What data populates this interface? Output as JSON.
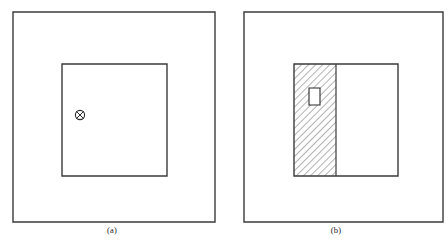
{
  "figure": {
    "background_color": "#ffffff",
    "line_color": "#3b3b3b",
    "panel_count": 2
  },
  "panels": [
    {
      "id": "a",
      "caption": "(a)",
      "outer_square": {
        "x": 13,
        "y": 12,
        "width": 202,
        "height": 210
      },
      "inner_square": {
        "x": 62,
        "y": 64,
        "width": 105,
        "height": 112
      },
      "symbols": [
        {
          "name": "vector-into-page",
          "glyph": "circled-x",
          "cx": 80,
          "cy": 115,
          "r": 5
        }
      ]
    },
    {
      "id": "b",
      "caption": "(b)",
      "outer_square": {
        "x": 20,
        "y": 12,
        "width": 199,
        "height": 210
      },
      "inner_square": {
        "x": 70,
        "y": 64,
        "width": 104,
        "height": 112
      },
      "hatched_region": {
        "x": 70,
        "y": 64,
        "width": 42,
        "height": 112,
        "hatch_angle_deg": 45,
        "hatch_direction": "lower-left-to-upper-right",
        "hatch_spacing_px": 5,
        "hatch_color": "#555555"
      },
      "divider_line": {
        "x": 112,
        "y_top": 64,
        "y_bottom": 176
      },
      "small_rect": {
        "x": 85,
        "y": 88,
        "width": 11,
        "height": 17,
        "fill": "#ffffff"
      }
    }
  ],
  "captions": {
    "panel_a": "(a)",
    "panel_b": "(b)"
  }
}
